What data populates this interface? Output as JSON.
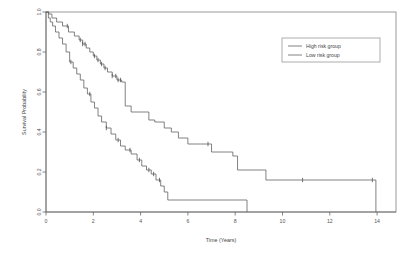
{
  "chart_data": {
    "type": "line",
    "subtype": "kaplan-meier-survival",
    "title": "",
    "xlabel": "Time (Years)",
    "ylabel": "Survival Probability",
    "xlim": [
      0,
      14.8
    ],
    "ylim": [
      0.0,
      1.0
    ],
    "xticks": [
      0,
      2,
      4,
      6,
      8,
      10,
      12,
      14
    ],
    "xtick_labels": [
      "0",
      "2",
      "4",
      "6",
      "8",
      "10",
      "12",
      "14"
    ],
    "yticks": [
      0.0,
      0.2,
      0.4,
      0.6,
      0.8,
      1.0
    ],
    "ytick_labels": [
      "0.0",
      "0.2",
      "0.4",
      "0.6",
      "0.8",
      "1.0"
    ],
    "grid": false,
    "legend_position": "top-right",
    "series": [
      {
        "name": "High risk group",
        "color": "#5a5a5a",
        "linestyle": "solid",
        "steps": [
          [
            0.0,
            1.0
          ],
          [
            0.1,
            0.97
          ],
          [
            0.18,
            0.95
          ],
          [
            0.28,
            0.93
          ],
          [
            0.4,
            0.9
          ],
          [
            0.55,
            0.87
          ],
          [
            0.7,
            0.84
          ],
          [
            0.85,
            0.8
          ],
          [
            1.0,
            0.75
          ],
          [
            1.15,
            0.72
          ],
          [
            1.3,
            0.69
          ],
          [
            1.45,
            0.66
          ],
          [
            1.6,
            0.62
          ],
          [
            1.75,
            0.59
          ],
          [
            1.9,
            0.55
          ],
          [
            2.05,
            0.52
          ],
          [
            2.2,
            0.48
          ],
          [
            2.35,
            0.45
          ],
          [
            2.55,
            0.42
          ],
          [
            2.75,
            0.39
          ],
          [
            2.95,
            0.36
          ],
          [
            3.15,
            0.33
          ],
          [
            3.35,
            0.31
          ],
          [
            3.6,
            0.29
          ],
          [
            3.85,
            0.26
          ],
          [
            4.05,
            0.23
          ],
          [
            4.25,
            0.21
          ],
          [
            4.45,
            0.19
          ],
          [
            4.65,
            0.16
          ],
          [
            4.85,
            0.13
          ],
          [
            5.0,
            0.1
          ],
          [
            5.15,
            0.06
          ],
          [
            8.5,
            0.06
          ],
          [
            8.5,
            0.0
          ]
        ],
        "censor_times": [
          1.05,
          1.85,
          2.55,
          3.05,
          3.55,
          3.95,
          4.35,
          4.55,
          4.8
        ]
      },
      {
        "name": "Low risk group",
        "color": "#5a5a5a",
        "linestyle": "solid",
        "steps": [
          [
            0.0,
            1.0
          ],
          [
            0.12,
            0.99
          ],
          [
            0.25,
            0.97
          ],
          [
            0.45,
            0.95
          ],
          [
            0.7,
            0.93
          ],
          [
            0.95,
            0.9
          ],
          [
            1.2,
            0.88
          ],
          [
            1.4,
            0.86
          ],
          [
            1.55,
            0.84
          ],
          [
            1.7,
            0.82
          ],
          [
            1.85,
            0.8
          ],
          [
            2.0,
            0.78
          ],
          [
            2.15,
            0.76
          ],
          [
            2.3,
            0.74
          ],
          [
            2.45,
            0.72
          ],
          [
            2.6,
            0.7
          ],
          [
            2.8,
            0.68
          ],
          [
            3.0,
            0.66
          ],
          [
            3.2,
            0.65
          ],
          [
            3.35,
            0.53
          ],
          [
            3.6,
            0.5
          ],
          [
            4.1,
            0.5
          ],
          [
            4.35,
            0.46
          ],
          [
            4.6,
            0.45
          ],
          [
            5.0,
            0.42
          ],
          [
            5.3,
            0.4
          ],
          [
            5.6,
            0.37
          ],
          [
            6.0,
            0.34
          ],
          [
            6.9,
            0.34
          ],
          [
            7.0,
            0.3
          ],
          [
            7.7,
            0.3
          ],
          [
            7.9,
            0.28
          ],
          [
            8.1,
            0.21
          ],
          [
            9.2,
            0.21
          ],
          [
            9.3,
            0.16
          ],
          [
            13.95,
            0.16
          ],
          [
            13.95,
            0.0
          ]
        ],
        "censor_times": [
          0.9,
          1.45,
          1.55,
          1.65,
          2.05,
          2.2,
          2.35,
          2.5,
          2.8,
          2.95,
          3.05,
          3.15,
          6.85,
          10.85,
          13.8
        ]
      }
    ]
  },
  "legend": {
    "entries": [
      {
        "label": "High risk group"
      },
      {
        "label": "Low risk group"
      }
    ]
  }
}
